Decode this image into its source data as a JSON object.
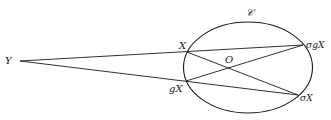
{
  "diagram": {
    "curve_label": "𝒞",
    "ellipse": {
      "cx": 248,
      "cy": 67.5,
      "rx": 64.5,
      "ry": 45.5
    },
    "points": {
      "Y": {
        "label": "Y",
        "x": 20,
        "y": 61
      },
      "X": {
        "label": "X",
        "x": 187,
        "y": 52
      },
      "gX": {
        "label": "gX",
        "x": 186,
        "y": 81
      },
      "sgX": {
        "label": "σgX",
        "x": 303,
        "y": 45
      },
      "sX": {
        "label": "σX",
        "x": 298,
        "y": 95
      },
      "O": {
        "label": "O",
        "x": 229,
        "y": 68
      }
    },
    "segments": [
      [
        "Y",
        "sgX"
      ],
      [
        "Y",
        "sX"
      ],
      [
        "X",
        "sX"
      ],
      [
        "gX",
        "sgX"
      ]
    ],
    "colors": {
      "stroke": "#1a1a1a",
      "text": "#222222",
      "background": "#ffffff"
    }
  }
}
